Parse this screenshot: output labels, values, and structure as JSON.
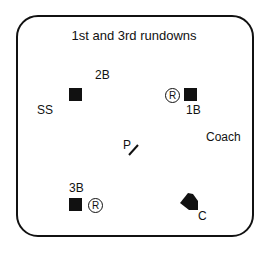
{
  "title": "1st and 3rd rundowns",
  "positions": {
    "second_base": "2B",
    "shortstop": "SS",
    "first_base": "1B",
    "coach": "Coach",
    "pitcher": "P",
    "third_base": "3B",
    "catcher": "C"
  },
  "runners": {
    "first": "R",
    "third": "R"
  }
}
